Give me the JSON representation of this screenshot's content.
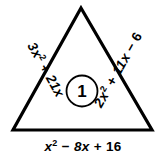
{
  "figure": {
    "type": "geometry-triangle-diagram",
    "background_color": "#ffffff",
    "stroke_color": "#000000",
    "problem_number": "1",
    "center_label": "1",
    "triangle": {
      "apex": [
        81,
        8
      ],
      "bottom_left": [
        13,
        130
      ],
      "bottom_right": [
        152,
        130
      ]
    },
    "edges": {
      "left": {
        "name": "left-side-expression",
        "coefficient_term": "3x",
        "exponent": "2",
        "operator": "+",
        "second_term": "21x",
        "full_text": "3x² + 21x"
      },
      "right": {
        "name": "right-side-expression",
        "coefficient_term": "2x",
        "exponent": "2",
        "operator": "+",
        "second_term": "11x",
        "operator2": "−",
        "third_term": "6",
        "full_text": "2x² + 11x − 6"
      },
      "bottom": {
        "name": "bottom-side-expression",
        "coefficient_term": "x",
        "exponent": "2",
        "operator": "−",
        "second_term": "8x",
        "operator2": "+",
        "third_term": "16",
        "full_text": "x² − 8x + 16"
      }
    }
  }
}
